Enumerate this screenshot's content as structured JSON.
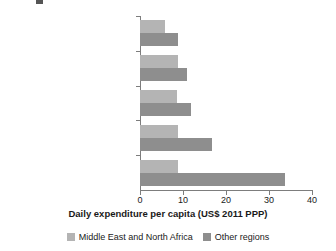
{
  "chart_data": {
    "type": "bar",
    "orientation": "horizontal",
    "title": "",
    "xlabel": "Daily expenditure per capita (US$ 2011 PPP)",
    "ylabel": "",
    "xlim": [
      0,
      40
    ],
    "xticks": [
      0,
      10,
      20,
      30,
      40
    ],
    "xtick_labels": [
      "0",
      "10",
      "20",
      "30",
      "40"
    ],
    "grid": false,
    "legend_position": "bottom",
    "categories": [
      "No education",
      "Primary incomplete",
      "Primary complete",
      "Secondary complete",
      "Some tertiary or postsecondary"
    ],
    "series": [
      {
        "name": "Middle East and North Africa",
        "color": "#b4b4b4",
        "values": [
          5.8,
          8.8,
          8.6,
          8.8,
          8.8
        ]
      },
      {
        "name": "Other regions",
        "color": "#8e8e8e",
        "values": [
          8.8,
          10.9,
          11.9,
          16.7,
          33.7
        ]
      }
    ]
  },
  "title_remnant": "",
  "legend": {
    "items": [
      {
        "label": "Middle East and North Africa",
        "color": "#b4b4b4"
      },
      {
        "label": "Other regions",
        "color": "#8e8e8e"
      }
    ]
  }
}
